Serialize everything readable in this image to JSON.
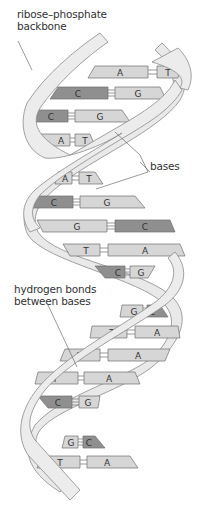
{
  "diagram": {
    "colors": {
      "backbone_fill": "#e9e9e9",
      "backbone_stroke": "#8a8a8a",
      "light_base": "#d6d6d6",
      "dark_base": "#8f8f8f",
      "stroke": "#6e6e6e",
      "text": "#333333"
    },
    "labels": {
      "backbone": [
        "ribose–phosphate",
        "backbone"
      ],
      "bases": "bases",
      "hbonds": [
        "hydrogen bonds",
        "between bases"
      ]
    },
    "base_pairs": [
      {
        "left": "A",
        "right": "T"
      },
      {
        "left": "C",
        "right": "G"
      },
      {
        "left": "C",
        "right": "G"
      },
      {
        "left": "A",
        "right": "T"
      },
      {
        "left": "A",
        "right": "T"
      },
      {
        "left": "C",
        "right": "G"
      },
      {
        "left": "G",
        "right": "C"
      },
      {
        "left": "T",
        "right": "A"
      },
      {
        "left": "C",
        "right": "G"
      },
      {
        "left": "G",
        "right": "C"
      },
      {
        "left": "T",
        "right": "A"
      },
      {
        "left": "T",
        "right": "A"
      },
      {
        "left": "T",
        "right": "A"
      },
      {
        "left": "C",
        "right": "G"
      },
      {
        "left": "G",
        "right": "C"
      },
      {
        "left": "T",
        "right": "A"
      }
    ]
  }
}
